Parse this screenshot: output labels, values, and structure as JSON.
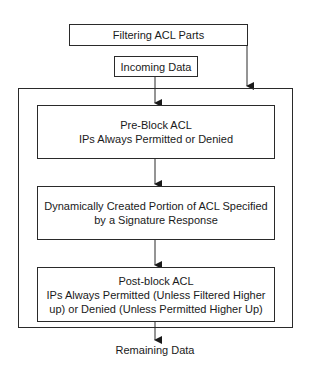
{
  "diagram": {
    "title_box": {
      "label": "Filtering ACL Parts"
    },
    "input_box": {
      "label": "Incoming Data"
    },
    "stages": [
      {
        "lines": [
          "Pre-Block ACL",
          "IPs Always Permitted or Denied"
        ]
      },
      {
        "lines": [
          "Dynamically Created Portion of ACL Specified",
          "by a Signature Response"
        ]
      },
      {
        "lines": [
          "Post-block ACL",
          "IPs Always Permitted (Unless Filtered Higher",
          "up) or Denied (Unless Permitted Higher Up)"
        ]
      }
    ],
    "output": {
      "label": "Remaining Data"
    },
    "colors": {
      "line": "#2a2a2a",
      "background": "#ffffff",
      "text": "#1a1a1a"
    }
  }
}
